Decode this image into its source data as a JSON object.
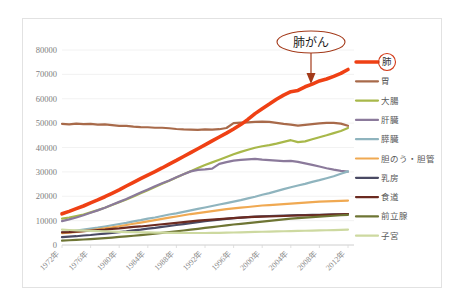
{
  "chart_data": {
    "type": "line",
    "title": "",
    "xlabel": "",
    "ylabel": "",
    "ylim": [
      0,
      80000
    ],
    "grid": true,
    "legend_position": "right",
    "ytick_labels": [
      "80000",
      "70000",
      "60000",
      "50000",
      "40000",
      "30000",
      "20000",
      "10000",
      "0"
    ],
    "ytick_values": [
      80000,
      70000,
      60000,
      50000,
      40000,
      30000,
      20000,
      10000,
      0
    ],
    "xtick_labels": [
      "1972年",
      "1976年",
      "1980年",
      "1984年",
      "1988年",
      "1992年",
      "1996年",
      "2000年",
      "2004年",
      "2008年",
      "2012年"
    ],
    "xtick_values": [
      1972,
      1976,
      1980,
      1984,
      1988,
      1992,
      1996,
      2000,
      2004,
      2008,
      2012
    ],
    "x": [
      1972,
      1973,
      1974,
      1975,
      1976,
      1977,
      1978,
      1979,
      1980,
      1981,
      1982,
      1983,
      1984,
      1985,
      1986,
      1987,
      1988,
      1989,
      1990,
      1991,
      1992,
      1993,
      1994,
      1995,
      1996,
      1997,
      1998,
      1999,
      2000,
      2001,
      2002,
      2003,
      2004,
      2005,
      2006,
      2007,
      2008,
      2009,
      2010,
      2011,
      2012
    ],
    "annotations": [
      {
        "text": "肺がん",
        "target_series": "肺",
        "color": "#a33a1a"
      }
    ],
    "series": [
      {
        "name": "肺",
        "color": "#ef4014",
        "highlight": true,
        "width": 3.6,
        "values": [
          12800,
          13800,
          14900,
          16000,
          17300,
          18500,
          19800,
          21200,
          22600,
          24200,
          25700,
          27200,
          28700,
          30100,
          31600,
          33200,
          34700,
          36300,
          37900,
          39500,
          41100,
          42700,
          44300,
          45900,
          47600,
          49400,
          51500,
          53900,
          55900,
          57800,
          59800,
          61500,
          62900,
          63400,
          64900,
          66000,
          67300,
          68100,
          69200,
          70400,
          72000
        ]
      },
      {
        "name": "胃",
        "color": "#a86a4a",
        "highlight": false,
        "width": 2.2,
        "values": [
          49700,
          49500,
          49800,
          49600,
          49700,
          49400,
          49500,
          49200,
          48900,
          48900,
          48600,
          48400,
          48300,
          48100,
          48100,
          47900,
          47600,
          47400,
          47300,
          47200,
          47400,
          47300,
          47500,
          48000,
          50000,
          50200,
          50300,
          50500,
          50600,
          50500,
          50100,
          49700,
          49400,
          49000,
          49300,
          49600,
          49900,
          50100,
          50100,
          49800,
          48900
        ]
      },
      {
        "name": "大腸",
        "color": "#a8b84a",
        "highlight": false,
        "width": 2.2,
        "values": [
          10800,
          11300,
          11900,
          12500,
          13400,
          14300,
          15300,
          16400,
          17500,
          18700,
          19900,
          21200,
          22500,
          23800,
          25100,
          26400,
          27700,
          29000,
          30300,
          31600,
          32800,
          33900,
          35000,
          36100,
          37200,
          38200,
          39100,
          39900,
          40500,
          41000,
          41600,
          42300,
          43000,
          42200,
          42500,
          43400,
          44200,
          45000,
          45900,
          46800,
          48000
        ]
      },
      {
        "name": "肝臓",
        "color": "#8b7a9b",
        "highlight": false,
        "width": 2.2,
        "values": [
          9800,
          10500,
          11300,
          12200,
          13200,
          14200,
          15300,
          16500,
          17700,
          18900,
          20200,
          21500,
          22800,
          24100,
          25300,
          26500,
          27800,
          29000,
          30200,
          30800,
          31000,
          31300,
          33300,
          34000,
          34600,
          34900,
          35100,
          35300,
          35000,
          34800,
          34600,
          34400,
          34500,
          34100,
          33500,
          32900,
          32200,
          31500,
          30900,
          30400,
          30100
        ]
      },
      {
        "name": "膵臓",
        "color": "#8fb4be",
        "highlight": false,
        "width": 2.2,
        "values": [
          5200,
          5500,
          5900,
          6300,
          6700,
          7100,
          7600,
          8100,
          8600,
          9100,
          9700,
          10200,
          10800,
          11300,
          11900,
          12500,
          13000,
          13600,
          14200,
          14800,
          15400,
          16000,
          16600,
          17200,
          17800,
          18400,
          19100,
          19800,
          20600,
          21300,
          22100,
          22900,
          23700,
          24400,
          25100,
          25900,
          26600,
          27400,
          28200,
          29200,
          30200
        ]
      },
      {
        "name": "胆のう・胆管",
        "color": "#f0a952",
        "highlight": false,
        "width": 2.2,
        "values": [
          4900,
          5100,
          5400,
          5700,
          6000,
          6400,
          6800,
          7200,
          7700,
          8200,
          8700,
          9200,
          9700,
          10200,
          10700,
          11200,
          11700,
          12200,
          12700,
          13100,
          13500,
          13900,
          14300,
          14700,
          15000,
          15300,
          15600,
          15900,
          16200,
          16400,
          16600,
          16800,
          17000,
          17200,
          17400,
          17600,
          17800,
          17900,
          18000,
          18100,
          18200
        ]
      },
      {
        "name": "乳房",
        "color": "#4a4a63",
        "highlight": false,
        "width": 2.2,
        "values": [
          3200,
          3400,
          3600,
          3900,
          4100,
          4400,
          4700,
          5000,
          5300,
          5600,
          6000,
          6300,
          6700,
          7000,
          7400,
          7800,
          8200,
          8600,
          9000,
          9400,
          9800,
          10100,
          10400,
          10700,
          11000,
          11200,
          11400,
          11600,
          11800,
          11900,
          12000,
          12100,
          12200,
          12250,
          12300,
          12350,
          12400,
          12500,
          12550,
          12600,
          12650
        ]
      },
      {
        "name": "食道",
        "color": "#6b2a20",
        "highlight": false,
        "width": 2.2,
        "values": [
          5200,
          5300,
          5500,
          5700,
          5900,
          6100,
          6300,
          6600,
          6800,
          7100,
          7400,
          7600,
          7900,
          8200,
          8500,
          8800,
          9100,
          9400,
          9700,
          10000,
          10200,
          10400,
          10600,
          10800,
          11000,
          11200,
          11400,
          11500,
          11600,
          11700,
          11800,
          11900,
          12000,
          12100,
          12150,
          12200,
          12300,
          12400,
          12500,
          12600,
          12700
        ]
      },
      {
        "name": "前立腺",
        "color": "#6e7534",
        "highlight": false,
        "width": 2.2,
        "values": [
          1800,
          1950,
          2100,
          2250,
          2450,
          2650,
          2850,
          3050,
          3300,
          3550,
          3800,
          4050,
          4350,
          4650,
          4950,
          5250,
          5600,
          5950,
          6300,
          6650,
          7000,
          7350,
          7700,
          8050,
          8400,
          8700,
          9000,
          9300,
          9600,
          9900,
          10200,
          10500,
          10800,
          11000,
          11200,
          11400,
          11600,
          11800,
          12000,
          12200,
          12400
        ]
      },
      {
        "name": "子宮",
        "color": "#cdd9a0",
        "highlight": false,
        "width": 2.2,
        "values": [
          6300,
          6150,
          6000,
          5900,
          5800,
          5700,
          5600,
          5500,
          5400,
          5300,
          5250,
          5200,
          5150,
          5100,
          5050,
          5000,
          4980,
          4950,
          4930,
          4920,
          4930,
          4950,
          5000,
          5050,
          5120,
          5200,
          5280,
          5350,
          5430,
          5500,
          5580,
          5650,
          5720,
          5780,
          5850,
          5920,
          5980,
          6050,
          6120,
          6200,
          6300
        ]
      }
    ]
  },
  "legend": {
    "items": [
      {
        "label": "肺"
      },
      {
        "label": "胃"
      },
      {
        "label": "大腸"
      },
      {
        "label": "肝臓"
      },
      {
        "label": "膵臓"
      },
      {
        "label": "胆のう・胆管"
      },
      {
        "label": "乳房"
      },
      {
        "label": "食道"
      },
      {
        "label": "前立腺"
      },
      {
        "label": "子宮"
      }
    ]
  },
  "callout": {
    "text": "肺がん",
    "color": "#a33a1a"
  },
  "colors": {
    "accent": "#ef4014",
    "panel_border": "#e2e2e2",
    "grid": "#efefef",
    "tick_text": "#7d7d7d"
  }
}
